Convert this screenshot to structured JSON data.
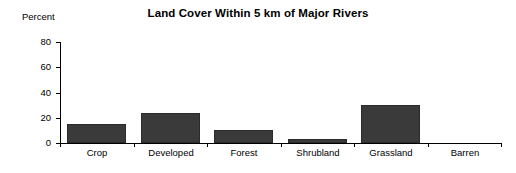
{
  "chart_data": {
    "type": "bar",
    "title": "Land Cover Within 5 km of Major Rivers",
    "xlabel": "",
    "ylabel": "Percent",
    "categories": [
      "Crop",
      "Developed",
      "Forest",
      "Shrubland",
      "Grassland",
      "Barren"
    ],
    "values": [
      15,
      24,
      10,
      3,
      30,
      0
    ],
    "ylim": [
      0,
      80
    ],
    "yticks": [
      0,
      20,
      40,
      60,
      80
    ],
    "ytick_labels": [
      "0",
      "20",
      "40",
      "60",
      "80"
    ],
    "grid": false,
    "legend": false,
    "bar_color": "#3a3a3a",
    "axis_color": "#000000",
    "background": "#ffffff"
  }
}
